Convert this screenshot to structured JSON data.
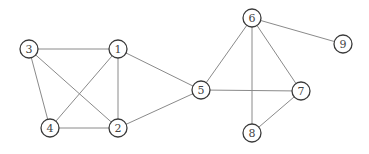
{
  "diagram": {
    "type": "undirected-graph",
    "node_radius": 9,
    "colors": {
      "edge": "#8a8a8a",
      "node_stroke": "#3a3a3a",
      "node_fill": "#ffffff",
      "label": "#444444"
    },
    "nodes": [
      {
        "id": "1",
        "label": "1",
        "x": 118,
        "y": 49
      },
      {
        "id": "2",
        "label": "2",
        "x": 118,
        "y": 128
      },
      {
        "id": "3",
        "label": "3",
        "x": 29,
        "y": 49
      },
      {
        "id": "4",
        "label": "4",
        "x": 50,
        "y": 128
      },
      {
        "id": "5",
        "label": "5",
        "x": 201,
        "y": 90
      },
      {
        "id": "6",
        "label": "6",
        "x": 252,
        "y": 18
      },
      {
        "id": "7",
        "label": "7",
        "x": 301,
        "y": 91
      },
      {
        "id": "8",
        "label": "8",
        "x": 252,
        "y": 133
      },
      {
        "id": "9",
        "label": "9",
        "x": 343,
        "y": 44
      }
    ],
    "edges": [
      [
        "3",
        "1"
      ],
      [
        "3",
        "4"
      ],
      [
        "3",
        "2"
      ],
      [
        "1",
        "4"
      ],
      [
        "1",
        "2"
      ],
      [
        "1",
        "5"
      ],
      [
        "4",
        "2"
      ],
      [
        "2",
        "5"
      ],
      [
        "5",
        "6"
      ],
      [
        "5",
        "7"
      ],
      [
        "6",
        "7"
      ],
      [
        "6",
        "8"
      ],
      [
        "6",
        "9"
      ],
      [
        "7",
        "8"
      ]
    ]
  }
}
